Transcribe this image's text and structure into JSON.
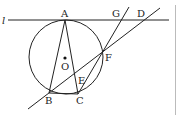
{
  "diagram": {
    "type": "geometry",
    "labels": {
      "l": "l",
      "A": "A",
      "B": "B",
      "C": "C",
      "D": "D",
      "E": "E",
      "F": "F",
      "G": "G",
      "O": "O"
    },
    "points": {
      "A": [
        65,
        20
      ],
      "B": [
        49,
        93
      ],
      "C": [
        78,
        94
      ],
      "D": [
        145,
        20
      ],
      "E": [
        77,
        77
      ],
      "F": [
        103,
        53
      ],
      "G": [
        121,
        20
      ],
      "O": [
        65,
        58
      ]
    },
    "circle": {
      "center": [
        68,
        56
      ],
      "radius": 38
    },
    "colors": {
      "stroke": "#222222",
      "divider": "#bbbbbb"
    }
  }
}
